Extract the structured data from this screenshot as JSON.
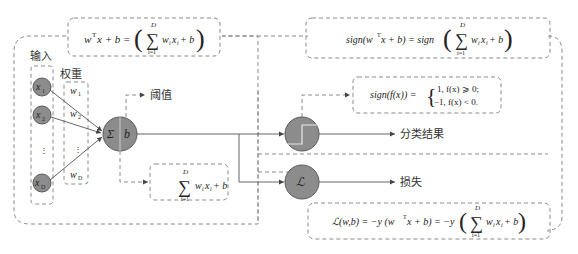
{
  "diagram": {
    "labels": {
      "input": "输入",
      "weights": "权重",
      "threshold": "阈值",
      "classification_result": "分类结果",
      "loss": "损失"
    },
    "inputs": [
      "x1",
      "x2",
      "⋮",
      "xD"
    ],
    "weights": [
      "w1",
      "w2",
      "⋮",
      "wD"
    ],
    "sum_node": {
      "sigma": "Σ",
      "bias": "b"
    },
    "sign_node": {
      "icon": "step-function"
    },
    "loss_node": {
      "symbol": "ℒ"
    },
    "formulas": {
      "linear": "wᵀx + b = ( Σ_{i=1}^{D} w_i x_i + b )",
      "weighted_sum": "Σ_{i=1}^{D} w_i x_i + b",
      "sign_output": "sign(wᵀx + b) = sign ( Σ_{i=1}^{D} w_i x_i + b )",
      "sign_def_line1": "1, f(x) ⩾ 0;",
      "sign_def_line2": "−1, f(x) < 0.",
      "sign_def_lhs": "sign(f(x)) =",
      "loss": "ℒ(w,b) = −y (wᵀx + b) = −y ( Σ_{i=1}^{D} w_i x_i + b )"
    },
    "colors": {
      "node_fill": "#8c8c8c",
      "dashed_stroke": "#8a8a8a",
      "line": "#555555"
    }
  }
}
